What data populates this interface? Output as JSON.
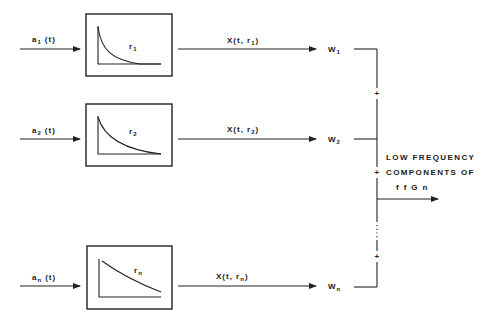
{
  "diagram": {
    "type": "block-diagram",
    "colors": {
      "ink": "#222222",
      "background": "#ffffff"
    },
    "channels": [
      {
        "input_label": "a",
        "input_sub": "1",
        "input_suffix": "(t)",
        "filter_label": "r",
        "filter_sub": "1",
        "output_label_pre": "X(t, r",
        "output_sub": "1",
        "output_label_post": ")",
        "weight_label": "W",
        "weight_sub": "1",
        "curve": "fast-decay"
      },
      {
        "input_label": "a",
        "input_sub": "2",
        "input_suffix": "(t)",
        "filter_label": "r",
        "filter_sub": "2",
        "output_label_pre": "X(t, r",
        "output_sub": "2",
        "output_label_post": ")",
        "weight_label": "W",
        "weight_sub": "2",
        "curve": "medium-decay"
      },
      {
        "input_label": "a",
        "input_sub": "n",
        "input_suffix": "(t)",
        "filter_label": "r",
        "filter_sub": "n",
        "output_label_pre": "X(t, r",
        "output_sub": "n",
        "output_label_post": ")",
        "weight_label": "W",
        "weight_sub": "n",
        "curve": "slow-decay"
      }
    ],
    "summing": {
      "plus_symbol": "+",
      "ellipsis": "⋮",
      "output_lines": [
        "LOW FREQUENCY",
        "COMPONENTS OF",
        "f f G n"
      ]
    }
  }
}
